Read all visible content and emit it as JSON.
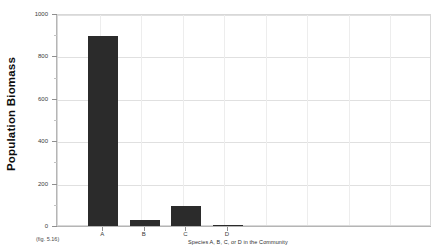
{
  "figure": {
    "reference_label": "(fig. 5.16)"
  },
  "chart_data": {
    "type": "bar",
    "title": "",
    "categories": [
      "A",
      "B",
      "C",
      "D"
    ],
    "values": [
      900,
      35,
      100,
      10
    ],
    "series": [
      {
        "name": "Population Biomass",
        "values": [
          900,
          35,
          100,
          10
        ]
      }
    ],
    "xlabel": "Species A, B, C, or D in the Community",
    "ylabel": "Population Biomass",
    "ylim": [
      0,
      1000
    ],
    "ytick_labels": [
      "0",
      "200",
      "400",
      "600",
      "800",
      "1000"
    ],
    "ytick_values": [
      0,
      200,
      400,
      600,
      800,
      1000
    ],
    "grid": "horizontal-and-vertical",
    "legend": "none",
    "bar_color": "#2b2b2b",
    "grid_color": "#e0e0e0",
    "axis_color": "#b5b5b5"
  }
}
